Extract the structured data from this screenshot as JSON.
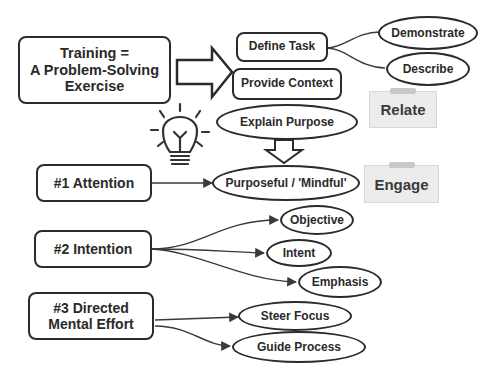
{
  "main_box": {
    "lines": [
      "Training =",
      "A Problem-Solving",
      "Exercise"
    ]
  },
  "steps": [
    {
      "label": "Define Task",
      "shape": "rounded-rect"
    },
    {
      "label": "Provide Context",
      "shape": "rounded-rect"
    },
    {
      "label": "Explain Purpose",
      "shape": "oval"
    }
  ],
  "define_task_children": [
    "Demonstrate",
    "Describe"
  ],
  "notes": {
    "relate": "Relate",
    "engage": "Engage"
  },
  "icons": {
    "lightbulb": "lightbulb-icon",
    "big_right_arrow": "block-arrow-right",
    "big_down_arrow": "block-arrow-down"
  },
  "principles": [
    {
      "label": "#1 Attention",
      "children": [
        "Purposeful / 'Mindful'"
      ]
    },
    {
      "label": "#2 Intention",
      "children": [
        "Objective",
        "Intent",
        "Emphasis"
      ]
    },
    {
      "label_lines": [
        "#3 Directed",
        "Mental Effort"
      ],
      "children": [
        "Steer Focus",
        "Guide Process"
      ]
    }
  ]
}
